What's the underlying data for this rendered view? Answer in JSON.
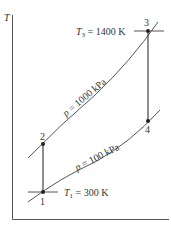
{
  "diagram": {
    "type": "T-s diagram (Brayton cycle)",
    "y_axis_label": "T",
    "states": [
      {
        "id": "1",
        "label": "1"
      },
      {
        "id": "2",
        "label": "2"
      },
      {
        "id": "3",
        "label": "3"
      },
      {
        "id": "4",
        "label": "4"
      }
    ],
    "isobars": [
      {
        "label_var": "p",
        "label_rest": " = 1000 kPa"
      },
      {
        "label_var": "p",
        "label_rest": " = 100 kPa"
      }
    ],
    "temperatures": {
      "t3_var": "T",
      "t3_sub": "3",
      "t3_rest": " = 1400 K",
      "t1_var": "T",
      "t1_sub": "1",
      "t1_rest": " = 300 K"
    }
  }
}
